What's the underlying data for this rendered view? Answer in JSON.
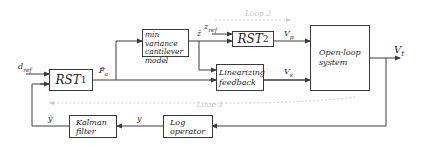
{
  "blocks": {
    "min_variance": {
      "line1": "min variance",
      "line2": "cantilever",
      "line3": "model"
    },
    "rst1": {
      "base": "RST",
      "sub": "1"
    },
    "rst2": {
      "base": "RST",
      "sub": "2"
    },
    "linearizing": {
      "line1": "Linearizing",
      "line2": "feedback"
    },
    "open_loop": {
      "line1": "Open-loop",
      "line2": "system"
    },
    "kalman": {
      "line1": "Kalman",
      "line2": "filter"
    },
    "log_op": {
      "line1": "Log",
      "line2": "operator"
    }
  },
  "signals": {
    "d_ref": "d",
    "d_ref_sub": "ref",
    "z_ref": "z",
    "z_ref_sub": "ref",
    "z_hat": "ẑ",
    "f_a_hat": "F̂",
    "f_a_hat_sub": "a",
    "v_p": "V",
    "v_p_sub": "p",
    "v_s": "V",
    "v_s_sub": "s",
    "v_t": "V",
    "v_t_sub": "t",
    "y": "y",
    "y_hat": "ŷ"
  },
  "loops": {
    "loop1": "Loop 1",
    "loop2": "Loop 2"
  },
  "colors": {
    "line": "#3a3a3a",
    "loop_dashed": "#c8c8c8"
  }
}
